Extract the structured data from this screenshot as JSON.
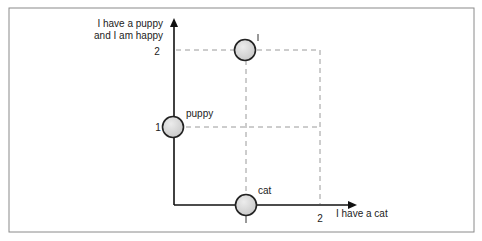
{
  "diagram": {
    "y_axis_label_line1": "I have a puppy",
    "y_axis_label_line2": "and I am happy",
    "x_axis_label": "I have a cat",
    "y_ticks": [
      "2",
      "1"
    ],
    "x_ticks": [
      "1",
      "2"
    ],
    "points": [
      {
        "label": "I",
        "x": 1,
        "y": 2
      },
      {
        "label": "puppy",
        "x": 0,
        "y": 1
      },
      {
        "label": "cat",
        "x": 1,
        "y": 0
      }
    ],
    "colors": {
      "axis": "#111111",
      "dash": "#999999",
      "node_fill": "#d8d8d8",
      "node_stroke": "#222222",
      "frame": "#888888"
    }
  }
}
